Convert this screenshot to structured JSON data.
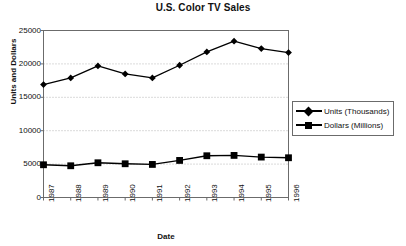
{
  "chart_data": {
    "type": "line",
    "title": "U.S. Color TV Sales",
    "xlabel": "Date",
    "ylabel": "Units and Dollars",
    "categories": [
      "1987",
      "1988",
      "1989",
      "1990",
      "1991",
      "1992",
      "1993",
      "1994",
      "1995",
      "1996"
    ],
    "ylim": [
      0,
      25000
    ],
    "ytick_labels": [
      "0",
      "5000",
      "10000",
      "15000",
      "20000",
      "25000"
    ],
    "yticks": [
      0,
      5000,
      10000,
      15000,
      20000,
      25000
    ],
    "grid": true,
    "grid_style": "dotted-horizontal",
    "legend_position": "right-middle",
    "series": [
      {
        "name": "Units (Thousands)",
        "marker": "diamond",
        "color": "#000000",
        "values": [
          16900,
          17900,
          19700,
          18500,
          17900,
          19800,
          21800,
          23400,
          22300,
          21700
        ]
      },
      {
        "name": "Dollars (Millions)",
        "marker": "square",
        "color": "#000000",
        "values": [
          4900,
          4750,
          5200,
          5050,
          4950,
          5550,
          6250,
          6300,
          6050,
          5950
        ]
      }
    ]
  },
  "legend": {
    "entries": [
      {
        "label": "Units (Thousands)",
        "marker": "diamond-marker-icon"
      },
      {
        "label": "Dollars (Millions)",
        "marker": "square-marker-icon"
      }
    ]
  }
}
